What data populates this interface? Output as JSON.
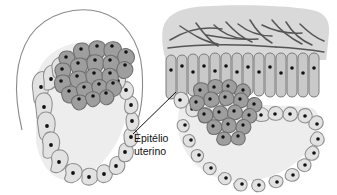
{
  "figure": {
    "background_color": "#ffffff",
    "width": 337,
    "height": 195
  },
  "labels": [
    {
      "id": "epitelio-uterino",
      "line1": "Epitélio",
      "line2": "uterino",
      "color": "#111111",
      "x": 134,
      "y": 139,
      "leader_from": [
        133,
        134
      ],
      "leader_to": [
        176,
        92
      ]
    }
  ],
  "palette": {
    "zona_pellucida_stroke": "#8a8a8a",
    "trophoblast_fill": "#e2e2e2",
    "trophoblast_stroke": "#8f8f8f",
    "inner_cell_mass_fill": "#9e9e9e",
    "inner_cell_mass_stroke": "#6f6f6f",
    "blastocoel_fill": "#ededed",
    "stroma_fill": "#d9d9d9",
    "collagen_stroke": "#555555",
    "epithelium_fill": "#c9c9c9",
    "epithelium_stroke": "#7d7d7d",
    "nucleus_fill": "#111111",
    "nucleus_light_fill": "#f2f2f2"
  },
  "panels": [
    {
      "id": "left-panel",
      "name": "free-blastocyst",
      "description": "Blastocisto livre envolvido pela zona pelúcida",
      "parts": [
        {
          "name": "zona-pellucida",
          "type": "open-arc"
        },
        {
          "name": "trophoblast-ring",
          "type": "cell-ring",
          "cell_count": 22
        },
        {
          "name": "inner-cell-mass",
          "type": "cell-cluster",
          "cell_count": 34
        },
        {
          "name": "blastocoel",
          "type": "cavity"
        }
      ]
    },
    {
      "id": "right-panel",
      "name": "implanting-blastocyst",
      "description": "Blastocisto implantando-se no epitélio uterino",
      "parts": [
        {
          "name": "endometrial-stroma",
          "type": "band"
        },
        {
          "name": "collagen-fibers",
          "type": "strokes",
          "count": 14
        },
        {
          "name": "uterine-epithelium",
          "type": "columnar-epithelium",
          "cell_count": 30
        },
        {
          "name": "trophoblast-ring",
          "type": "cell-ring",
          "cell_count": 20
        },
        {
          "name": "inner-cell-mass",
          "type": "cell-cluster",
          "cell_count": 30
        },
        {
          "name": "blastocoel",
          "type": "cavity"
        }
      ]
    }
  ]
}
